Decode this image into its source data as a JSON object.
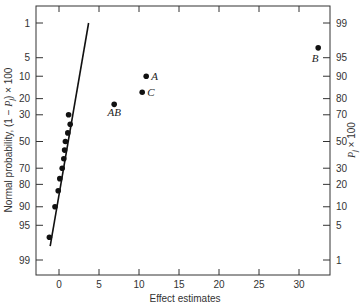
{
  "chart_data": {
    "type": "scatter",
    "title": "",
    "xlabel": "Effect estimates",
    "ylabel_left": "Normal probability, (1 − P_j) × 100",
    "ylabel_right": "P_j × 100",
    "xlim": [
      -3,
      34
    ],
    "x_ticks": [
      0,
      5,
      10,
      15,
      20,
      25,
      30
    ],
    "y_left_ticks": [
      1,
      5,
      10,
      20,
      30,
      50,
      70,
      80,
      90,
      95,
      99
    ],
    "y_right_ticks": [
      99,
      95,
      90,
      80,
      70,
      50,
      30,
      20,
      10,
      5,
      1
    ],
    "grid": false,
    "legend": null,
    "points": [
      {
        "x": -1.2,
        "p": 97.0,
        "label": ""
      },
      {
        "x": -0.5,
        "p": 90.0,
        "label": ""
      },
      {
        "x": -0.1,
        "p": 83.3,
        "label": ""
      },
      {
        "x": 0.1,
        "p": 76.7,
        "label": ""
      },
      {
        "x": 0.4,
        "p": 70.0,
        "label": ""
      },
      {
        "x": 0.6,
        "p": 63.3,
        "label": ""
      },
      {
        "x": 0.7,
        "p": 56.7,
        "label": ""
      },
      {
        "x": 0.8,
        "p": 50.0,
        "label": ""
      },
      {
        "x": 1.1,
        "p": 43.3,
        "label": ""
      },
      {
        "x": 1.4,
        "p": 36.7,
        "label": ""
      },
      {
        "x": 1.2,
        "p": 30.0,
        "label": ""
      },
      {
        "x": 6.9,
        "p": 23.3,
        "label": "AB"
      },
      {
        "x": 10.4,
        "p": 16.7,
        "label": "C"
      },
      {
        "x": 10.9,
        "p": 10.0,
        "label": "A"
      },
      {
        "x": 32.4,
        "p": 3.3,
        "label": "B"
      }
    ],
    "fit_line": {
      "x1": -1.1,
      "p1": 98.0,
      "x2": 3.7,
      "p2": 1.0
    }
  }
}
